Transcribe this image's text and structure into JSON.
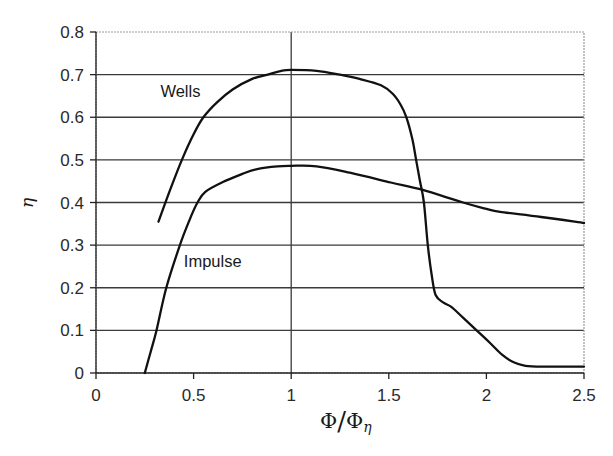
{
  "chart_data": {
    "type": "line",
    "title": "",
    "xlabel": "Φ/Φη",
    "ylabel": "η",
    "xlim": [
      0,
      2.5
    ],
    "ylim": [
      0,
      0.8
    ],
    "xticks": [
      0,
      0.5,
      1,
      1.5,
      2,
      2.5
    ],
    "xtick_labels": [
      "0",
      "0.5",
      "1",
      "1.5",
      "2",
      "2.5"
    ],
    "yticks": [
      0,
      0.1,
      0.2,
      0.3,
      0.4,
      0.5,
      0.6,
      0.7,
      0.8
    ],
    "ytick_labels": [
      "0",
      "0.1",
      "0.2",
      "0.3",
      "0.4",
      "0.5",
      "0.6",
      "0.7",
      "0.8"
    ],
    "grid": {
      "horizontal": true,
      "vertical_at": [
        1
      ]
    },
    "legend": "inline labels",
    "series": [
      {
        "name": "Wells",
        "label_pos": {
          "x": 0.33,
          "y": 0.648
        },
        "x": [
          0.32,
          0.38,
          0.44,
          0.5,
          0.55,
          0.62,
          0.7,
          0.8,
          0.88,
          0.95,
          1.0,
          1.13,
          1.25,
          1.35,
          1.46,
          1.52,
          1.56,
          1.59,
          1.62,
          1.64,
          1.66,
          1.68,
          1.7,
          1.72,
          1.74,
          1.78,
          1.82,
          1.88,
          1.95,
          2.02,
          2.08,
          2.14,
          2.2,
          2.3,
          2.4,
          2.5
        ],
        "y": [
          0.355,
          0.43,
          0.5,
          0.56,
          0.6,
          0.635,
          0.665,
          0.69,
          0.7,
          0.709,
          0.711,
          0.709,
          0.7,
          0.69,
          0.675,
          0.655,
          0.63,
          0.6,
          0.55,
          0.5,
          0.45,
          0.4,
          0.3,
          0.23,
          0.183,
          0.165,
          0.155,
          0.13,
          0.1,
          0.07,
          0.043,
          0.025,
          0.017,
          0.015,
          0.015,
          0.015
        ]
      },
      {
        "name": "Impulse",
        "label_pos": {
          "x": 0.45,
          "y": 0.248
        },
        "x": [
          0.25,
          0.28,
          0.31,
          0.36,
          0.43,
          0.48,
          0.52,
          0.56,
          0.65,
          0.75,
          0.82,
          0.93,
          1.0,
          1.13,
          1.3,
          1.51,
          1.67,
          1.88,
          2.0,
          2.07,
          2.28,
          2.5
        ],
        "y": [
          0.0,
          0.05,
          0.1,
          0.2,
          0.3,
          0.36,
          0.4,
          0.425,
          0.448,
          0.467,
          0.478,
          0.485,
          0.486,
          0.485,
          0.47,
          0.447,
          0.43,
          0.4,
          0.385,
          0.378,
          0.366,
          0.352
        ]
      }
    ]
  }
}
